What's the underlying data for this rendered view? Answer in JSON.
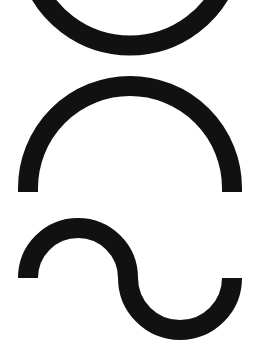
{
  "figure": {
    "background": "#ffffff",
    "stroke_color": "#111111",
    "shapes": [
      {
        "name": "bottom-arc",
        "description": "Lower half of a ring (U-shaped curve), cut off at top edge"
      },
      {
        "name": "top-arch",
        "description": "Upper semicircular arch"
      },
      {
        "name": "sine-wave",
        "description": "One full period S-shaped wave (tilde-like)"
      }
    ]
  }
}
